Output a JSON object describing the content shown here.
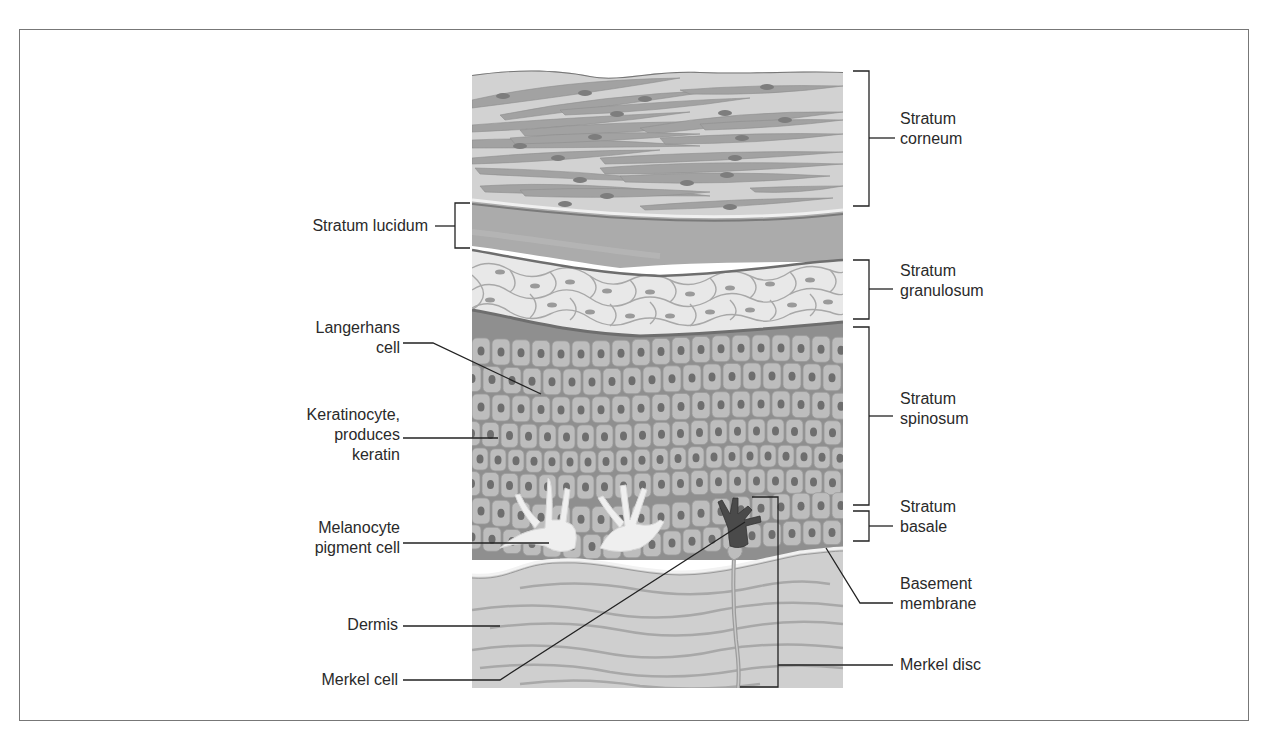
{
  "diagram": {
    "left_labels": [
      {
        "id": "stratum-lucidum",
        "lines": [
          "Stratum lucidum"
        ]
      },
      {
        "id": "langerhans-cell",
        "lines": [
          "Langerhans",
          "cell"
        ]
      },
      {
        "id": "keratinocyte",
        "lines": [
          "Keratinocyte,",
          "produces",
          "keratin"
        ]
      },
      {
        "id": "melanocyte",
        "lines": [
          "Melanocyte",
          "pigment cell"
        ]
      },
      {
        "id": "dermis",
        "lines": [
          "Dermis"
        ]
      },
      {
        "id": "merkel-cell",
        "lines": [
          "Merkel cell"
        ]
      }
    ],
    "right_labels": [
      {
        "id": "stratum-corneum",
        "lines": [
          "Stratum",
          "corneum"
        ]
      },
      {
        "id": "stratum-granulosum",
        "lines": [
          "Stratum",
          "granulosum"
        ]
      },
      {
        "id": "stratum-spinosum",
        "lines": [
          "Stratum",
          "spinosum"
        ]
      },
      {
        "id": "stratum-basale",
        "lines": [
          "Stratum",
          "basale"
        ]
      },
      {
        "id": "basement-membrane",
        "lines": [
          "Basement",
          "membrane"
        ]
      },
      {
        "id": "merkel-disc",
        "lines": [
          "Merkel disc"
        ]
      }
    ],
    "colors": {
      "frame": "#777777",
      "leader": "#222222",
      "corneum_bg": "#cfcfcf",
      "corneum_cell": "#9c9c9c",
      "lucidum": "#a8a8a8",
      "granulosum_bg": "#e6e6e6",
      "spinosum_bg": "#8e8e8e",
      "cell_fill": "#b9b9b9",
      "nucleus": "#6a6a6a",
      "dermis_bg": "#cdcdcd",
      "dermis_fiber": "#a3a3a3",
      "merkel": "#4a4a4a",
      "melanocyte": "#f2f2f2"
    }
  }
}
